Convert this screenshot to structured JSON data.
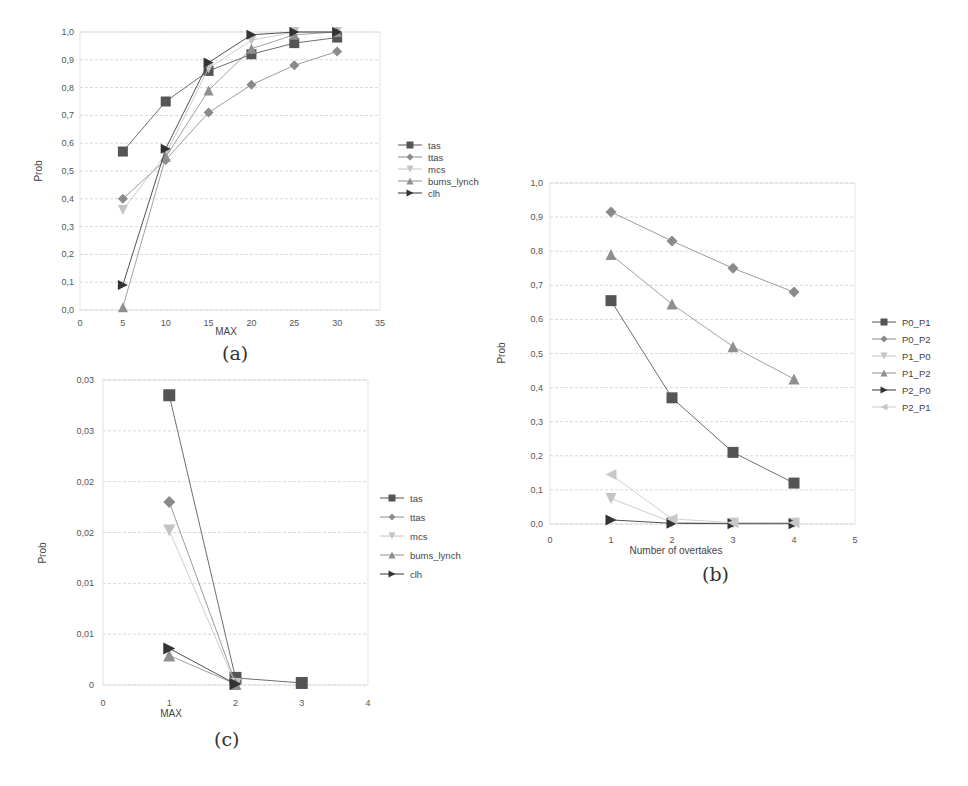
{
  "figure": {
    "captions": [
      "(a)",
      "(b)",
      "(c)"
    ]
  },
  "chart_data": [
    {
      "id": "a",
      "type": "line",
      "title": "",
      "caption": "(a)",
      "xlabel": "MAX",
      "ylabel": "Prob",
      "xlim": [
        0,
        35
      ],
      "ylim": [
        0,
        1.0
      ],
      "x_ticks": [
        "0",
        "5",
        "10",
        "15",
        "20",
        "25",
        "30",
        "35"
      ],
      "y_ticks": [
        "0,0",
        "0,1",
        "0,2",
        "0,3",
        "0,4",
        "0,5",
        "0,6",
        "0,7",
        "0,8",
        "0,9",
        "1,0"
      ],
      "grid": true,
      "legend_position": "right",
      "x": [
        5,
        10,
        15,
        20,
        25,
        30
      ],
      "series": [
        {
          "name": "tas",
          "marker": "square",
          "color": "#555555",
          "values": [
            0.57,
            0.75,
            0.86,
            0.92,
            0.96,
            0.98
          ]
        },
        {
          "name": "ttas",
          "marker": "diamond",
          "color": "#8a8a8a",
          "values": [
            0.4,
            0.54,
            0.71,
            0.81,
            0.88,
            0.93
          ]
        },
        {
          "name": "mcs",
          "marker": "triangle-down",
          "color": "#c4c4c4",
          "values": [
            0.36,
            0.56,
            0.87,
            0.97,
            1.0,
            1.0
          ]
        },
        {
          "name": "bums_lynch",
          "marker": "triangle-up",
          "color": "#8f8f8f",
          "values": [
            0.01,
            0.55,
            0.79,
            0.94,
            0.99,
            1.0
          ]
        },
        {
          "name": "clh",
          "marker": "triangle-right",
          "color": "#333333",
          "values": [
            0.09,
            0.58,
            0.89,
            0.99,
            1.0,
            1.0
          ]
        }
      ]
    },
    {
      "id": "b",
      "type": "line",
      "title": "",
      "caption": "(b)",
      "xlabel": "Number of overtakes",
      "ylabel": "Prob",
      "xlim": [
        0,
        5
      ],
      "ylim": [
        0,
        1.0
      ],
      "x_ticks": [
        "0",
        "1",
        "2",
        "3",
        "4",
        "5"
      ],
      "y_ticks": [
        "0,0",
        "0,1",
        "0,2",
        "0,3",
        "0,4",
        "0,5",
        "0,6",
        "0,7",
        "0,8",
        "0,9",
        "1,0"
      ],
      "grid": true,
      "legend_position": "right",
      "x": [
        1,
        2,
        3,
        4
      ],
      "series": [
        {
          "name": "P0_P1",
          "marker": "square",
          "color": "#555555",
          "values": [
            0.655,
            0.37,
            0.21,
            0.12
          ]
        },
        {
          "name": "P0_P2",
          "marker": "diamond",
          "color": "#8a8a8a",
          "values": [
            0.915,
            0.83,
            0.75,
            0.68
          ]
        },
        {
          "name": "P1_P0",
          "marker": "triangle-down",
          "color": "#c4c4c4",
          "values": [
            0.075,
            0.005,
            0.002,
            0.002
          ]
        },
        {
          "name": "P1_P2",
          "marker": "triangle-up",
          "color": "#8f8f8f",
          "values": [
            0.79,
            0.645,
            0.52,
            0.425
          ]
        },
        {
          "name": "P2_P0",
          "marker": "triangle-right",
          "color": "#333333",
          "values": [
            0.012,
            0.002,
            0.001,
            0.001
          ]
        },
        {
          "name": "P2_P1",
          "marker": "triangle-left",
          "color": "#c8c8c8",
          "values": [
            0.145,
            0.015,
            0.004,
            0.004
          ]
        }
      ]
    },
    {
      "id": "c",
      "type": "line",
      "title": "",
      "caption": "(c)",
      "xlabel": "MAX",
      "ylabel": "Prob",
      "xlim": [
        0,
        4
      ],
      "ylim": [
        0,
        0.03
      ],
      "x_ticks": [
        "0",
        "1",
        "2",
        "3",
        "4"
      ],
      "y_ticks": [
        "0",
        "0,01",
        "0,01",
        "0,02",
        "0,02",
        "0,03",
        "0,03"
      ],
      "grid": true,
      "legend_position": "right",
      "x": [
        1,
        2,
        3
      ],
      "series": [
        {
          "name": "tas",
          "marker": "square",
          "color": "#555555",
          "values": [
            0.0285,
            0.0007,
            0.0002
          ]
        },
        {
          "name": "ttas",
          "marker": "diamond",
          "color": "#8a8a8a",
          "values": [
            0.018,
            0.0002,
            null
          ]
        },
        {
          "name": "mcs",
          "marker": "triangle-down",
          "color": "#c4c4c4",
          "values": [
            0.0152,
            0.0001,
            null
          ]
        },
        {
          "name": "bums_lynch",
          "marker": "triangle-up",
          "color": "#8f8f8f",
          "values": [
            0.0029,
            0.0001,
            null
          ]
        },
        {
          "name": "clh",
          "marker": "triangle-right",
          "color": "#333333",
          "values": [
            0.0036,
            0.0001,
            null
          ]
        }
      ]
    }
  ]
}
